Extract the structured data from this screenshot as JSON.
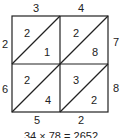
{
  "diagram": {
    "type": "lattice-multiplication",
    "top_digits": [
      "3",
      "4"
    ],
    "right_digits": [
      "7",
      "8"
    ],
    "left_digits": [
      "2",
      "6"
    ],
    "bottom_digits": [
      "5",
      "2"
    ],
    "cells": [
      {
        "row": 0,
        "col": 0,
        "tens": "2",
        "ones": "1"
      },
      {
        "row": 0,
        "col": 1,
        "tens": "2",
        "ones": "8"
      },
      {
        "row": 1,
        "col": 0,
        "tens": "2",
        "ones": "4"
      },
      {
        "row": 1,
        "col": 1,
        "tens": "3",
        "ones": "2"
      }
    ],
    "caption": "34 × 78 = 2652"
  }
}
